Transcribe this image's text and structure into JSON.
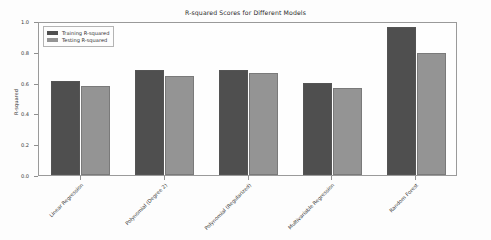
{
  "chart_data": {
    "type": "bar",
    "title": "R-squared Scores for Different Models",
    "xlabel": "",
    "ylabel": "R-squared",
    "ylim": [
      0.0,
      1.0
    ],
    "yticks": [
      "0.0",
      "0.2",
      "0.4",
      "0.6",
      "0.8",
      "1.0"
    ],
    "grid": false,
    "legend_position": "upper left",
    "categories": [
      "Linear Regression",
      "Polynomial (Degree 2)",
      "Polynomial (Regularized)",
      "Multivariable Regression",
      "Random Forest"
    ],
    "series": [
      {
        "name": "Training R-squared",
        "color": "#4f4f4f",
        "values": [
          0.61,
          0.685,
          0.68,
          0.6,
          0.96
        ]
      },
      {
        "name": "Testing R-squared",
        "color": "#949494",
        "values": [
          0.575,
          0.64,
          0.66,
          0.565,
          0.79
        ]
      }
    ]
  }
}
